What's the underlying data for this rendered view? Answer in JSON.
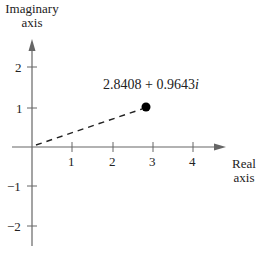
{
  "diagram": {
    "type": "complex-plane",
    "y_axis_label_line1": "Imaginary",
    "y_axis_label_line2": "axis",
    "x_axis_label_line1": "Real",
    "x_axis_label_line2": "axis",
    "x_ticks": [
      "1",
      "2",
      "3",
      "4"
    ],
    "y_ticks": [
      "2",
      "1",
      "−1",
      "−2"
    ],
    "point_label_real": "2.8408 + 0.9643",
    "point_label_imag_unit": "i",
    "point": {
      "re": 2.8408,
      "im": 0.9643
    },
    "colors": {
      "axis": "#666666",
      "text": "#222222",
      "point": "#000000"
    }
  }
}
